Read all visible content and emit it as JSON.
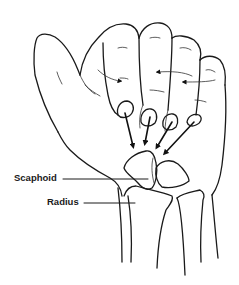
{
  "figure": {
    "labels": [
      {
        "id": "scaphoid",
        "text": "Scaphoid"
      },
      {
        "id": "radius",
        "text": "Radius"
      }
    ],
    "colors": {
      "line": "#1a1a1a",
      "background": "#ffffff"
    }
  }
}
